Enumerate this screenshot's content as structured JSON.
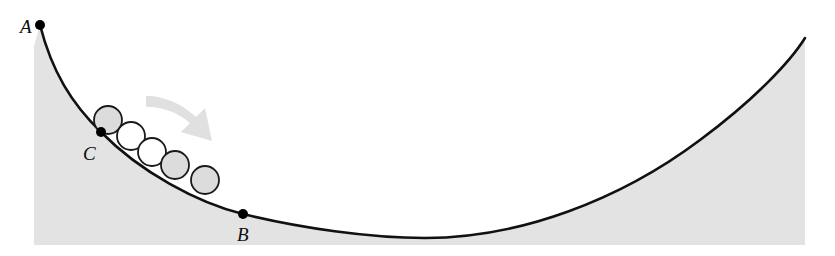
{
  "figure": {
    "width": 835,
    "height": 256,
    "background_color": "#ffffff"
  },
  "colors": {
    "curve_stroke": "#111111",
    "region_fill": "#e3e3e3",
    "ball_fill_shaded": "#dcdcdc",
    "ball_fill_open": "#ffffff",
    "ball_stroke": "#1a1a1a",
    "arrow_fill": "#e0e0e0",
    "point_marker": "#000000",
    "label_color": "#0d0d0d"
  },
  "labels": {
    "point_a": "A",
    "point_b": "B",
    "point_c": "C"
  },
  "points": [
    {
      "id": "A",
      "label": "A",
      "x": 40,
      "y": 25,
      "label_x": 20,
      "label_y": 33
    },
    {
      "id": "C",
      "label": "C",
      "x": 101,
      "y": 132,
      "label_x": 83,
      "label_y": 160
    },
    {
      "id": "B",
      "label": "B",
      "x": 243,
      "y": 214,
      "label_x": 237,
      "label_y": 241
    }
  ],
  "chart_data": {
    "type": "line",
    "xlabel": "",
    "ylabel": "",
    "grid": false,
    "legend": "none",
    "curve": {
      "name": "track",
      "description": "U-shaped concave-up curve from A at upper-left, through C and B, to a minimum near x=425, rising steeply to the right edge",
      "path": "M 40 25 C 52 72 72 104 101 132 C 140 172 198 203 243 214 C 300 228 370 238 425 238 C 520 238 620 200 700 140 C 755 99 790 62 805 38",
      "endpoints": [
        [
          40,
          25
        ],
        [
          805,
          38
        ]
      ],
      "minimum": [
        425,
        238
      ]
    },
    "shaded_region": {
      "name": "ground-below-track",
      "fill": "#e3e3e3",
      "left_edge_x": 34,
      "bottom_edge_y": 245,
      "right_edge_x": 805
    },
    "balls": [
      {
        "index": 1,
        "cx": 108,
        "cy": 120,
        "r": 14,
        "fill": "#dcdcdc"
      },
      {
        "index": 2,
        "cx": 131,
        "cy": 136,
        "r": 14,
        "fill": "#ffffff"
      },
      {
        "index": 3,
        "cx": 152,
        "cy": 152,
        "r": 14,
        "fill": "#ffffff"
      },
      {
        "index": 4,
        "cx": 175,
        "cy": 165,
        "r": 14,
        "fill": "#dcdcdc"
      },
      {
        "index": 5,
        "cx": 205,
        "cy": 180,
        "r": 14,
        "fill": "#dcdcdc"
      }
    ],
    "motion_arrow": {
      "name": "direction-of-motion-arrow",
      "from": [
        148,
        98
      ],
      "to": [
        208,
        138
      ],
      "fill": "#e0e0e0",
      "description": "curved block arrow pointing down-right showing direction of rolling"
    }
  }
}
